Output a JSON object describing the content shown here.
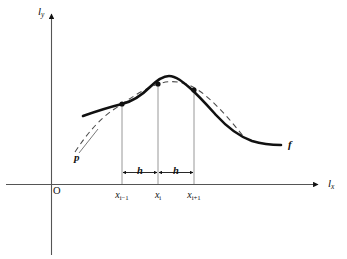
{
  "figure": {
    "kind": "math-diagram",
    "background_color": "#ffffff",
    "ink_color": "#111111"
  },
  "axes": {
    "y_axis": {
      "label_l": "l",
      "label_sub": "y"
    },
    "x_axis": {
      "label_l": "l",
      "label_sub": "x"
    },
    "origin_label": "O"
  },
  "ticks": [
    {
      "name": "x-i-minus-1",
      "base": "x",
      "sub": "i−1"
    },
    {
      "name": "x-i",
      "base": "x",
      "sub": "i"
    },
    {
      "name": "x-i-plus-1",
      "base": "x",
      "sub": "i+1"
    }
  ],
  "spacings": [
    {
      "name": "h-left",
      "label": "h"
    },
    {
      "name": "h-right",
      "label": "h"
    }
  ],
  "curves": [
    {
      "name": "function-curve",
      "label": "f",
      "style": "solid-bold"
    },
    {
      "name": "polynomial-curve",
      "label": "p",
      "style": "dashed"
    }
  ],
  "markers": [
    {
      "name": "sample-point-left"
    },
    {
      "name": "sample-point-mid"
    },
    {
      "name": "sample-point-right"
    }
  ]
}
